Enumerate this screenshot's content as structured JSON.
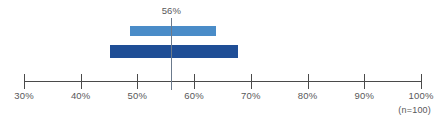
{
  "chart_data": {
    "type": "bar",
    "title": "",
    "subtitle": "",
    "xlabel": "",
    "ylabel": "",
    "xlim": [
      30,
      100
    ],
    "grid": false,
    "legend": "none",
    "orientation": "horizontal",
    "axis": {
      "ticks": [
        30,
        40,
        50,
        60,
        70,
        80,
        90,
        100
      ],
      "tick_labels": [
        "30%",
        "40%",
        "50%",
        "60%",
        "70%",
        "80%",
        "90%",
        "100%"
      ],
      "tick_color": "#4a4a4a"
    },
    "reference_line": {
      "value": 56,
      "label": "56%",
      "color": "#6b7a8c"
    },
    "ranges": [
      {
        "name": "outer-range",
        "start": 45.2,
        "end": 67.7,
        "color": "#1f4e96",
        "thickness": 13
      },
      {
        "name": "inner-range",
        "start": 48.7,
        "end": 63.9,
        "color": "#4a8cc8",
        "thickness": 10
      }
    ],
    "annotation": "(n=100)"
  },
  "footnote": {
    "sample_size": "(n=100)"
  }
}
